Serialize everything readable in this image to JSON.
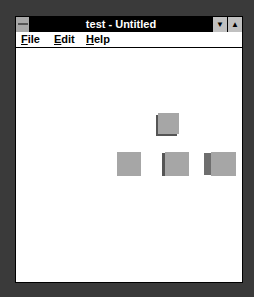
{
  "window": {
    "title": "test - Untitled",
    "minimize_glyph": "▼",
    "maximize_glyph": "▲"
  },
  "menu": {
    "items": [
      {
        "label": "File",
        "mnemonic": "F",
        "rest": "ile"
      },
      {
        "label": "Edit",
        "mnemonic": "E",
        "rest": "dit"
      },
      {
        "label": "Help",
        "mnemonic": "H",
        "rest": "elp"
      }
    ]
  },
  "canvas": {
    "cubes": [
      {
        "name": "top",
        "face_color": "#a6a6a6",
        "side_color": "#555555"
      },
      {
        "name": "bottom-left",
        "face_color": "#a6a6a6"
      },
      {
        "name": "bottom-middle",
        "face_color": "#a6a6a6",
        "side_color": "#555555"
      },
      {
        "name": "bottom-right",
        "face_color": "#a6a6a6",
        "side_color": "#6e6e6e"
      }
    ]
  }
}
